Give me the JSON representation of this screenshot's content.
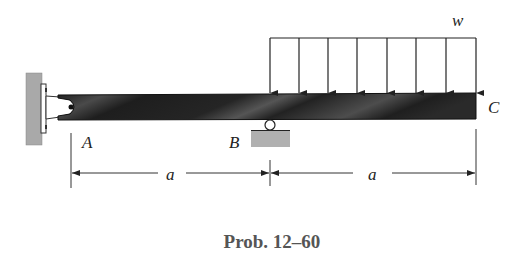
{
  "diagram": {
    "type": "beam-loading",
    "labels": {
      "load": "w",
      "point_a": "A",
      "point_b": "B",
      "point_c": "C",
      "span_ab": "a",
      "span_bc": "a"
    },
    "caption": "Prob. 12–60",
    "supports": {
      "A": "pin (wall bracket)",
      "B": "roller"
    },
    "load": {
      "kind": "uniform distributed",
      "from": "B",
      "to": "C",
      "arrow_count": 8
    },
    "colors": {
      "beam": "#2a2a2a",
      "wall": "#a9a9a9",
      "ground": "#b0b0b0",
      "lines": "#333333",
      "caption": "#555555"
    }
  }
}
